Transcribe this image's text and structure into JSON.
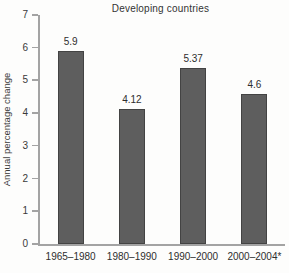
{
  "chart_data": {
    "type": "bar",
    "title": "Developing countries",
    "xlabel": "",
    "ylabel": "Annual percentage change",
    "categories": [
      "1965–1980",
      "1980–1990",
      "1990–2000",
      "2000–2004*"
    ],
    "values": [
      5.9,
      4.12,
      5.37,
      4.6
    ],
    "value_labels": [
      "5.9",
      "4.12",
      "5.37",
      "4.6"
    ],
    "ylim": [
      0,
      7
    ],
    "y_ticks": [
      0,
      1,
      2,
      3,
      4,
      5,
      6,
      7
    ],
    "grid": false,
    "legend_position": "none",
    "colors": {
      "bar": "#5e5e5e",
      "axis": "#a3a3a3",
      "text": "#2e2e2e"
    }
  }
}
